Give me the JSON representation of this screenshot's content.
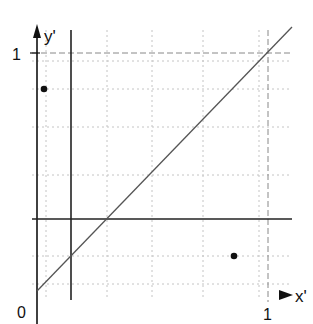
{
  "diagram": {
    "axes": {
      "x_label": "x'",
      "y_label": "y'",
      "origin_label": "0",
      "x_one_label": "1",
      "y_one_label": "1"
    },
    "colors": {
      "axis": "#111111",
      "line": "#555555",
      "grid": "#bbbbbb",
      "dashed": "#888888",
      "point": "#111111"
    },
    "elements": [
      {
        "type": "vertical-line",
        "x": 0.14
      },
      {
        "type": "horizontal-line",
        "y": 0.32
      },
      {
        "type": "diagonal-line",
        "from": [
          0,
          0.06
        ],
        "to": [
          1.07,
          1.08
        ]
      },
      {
        "type": "point",
        "x": 0.03,
        "y": 0.85
      },
      {
        "type": "point",
        "x": 0.79,
        "y": 0.14
      }
    ]
  }
}
